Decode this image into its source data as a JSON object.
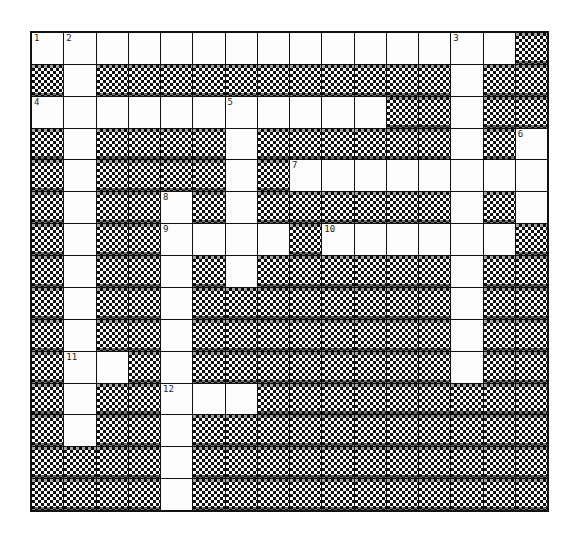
{
  "puzzle": {
    "rows": 15,
    "cols": 16,
    "colors": {
      "white": "#fdfdfd",
      "black": "#111111",
      "border": "#111111"
    },
    "grid": [
      "###############.",
      ".#...........#..",
      "###########..#..",
      ".#....#......#.#",
      ".#....#.########",
      ".#..#.#......#.#",
      ".#..####.######.",
      ".#..#.#......#..",
      ".#..#........#..",
      ".#..#........#..",
      ".##.#........#..",
      ".#..###.........",
      ".#..#...........",
      "....#...........",
      "....#..........."
    ],
    "numbers": [
      {
        "row": 0,
        "col": 0,
        "n": "1"
      },
      {
        "row": 0,
        "col": 1,
        "n": "2"
      },
      {
        "row": 0,
        "col": 13,
        "n": "3"
      },
      {
        "row": 2,
        "col": 0,
        "n": "4"
      },
      {
        "row": 2,
        "col": 6,
        "n": "5"
      },
      {
        "row": 3,
        "col": 15,
        "n": "6"
      },
      {
        "row": 4,
        "col": 8,
        "n": "7"
      },
      {
        "row": 5,
        "col": 4,
        "n": "8"
      },
      {
        "row": 6,
        "col": 4,
        "n": "9"
      },
      {
        "row": 6,
        "col": 9,
        "n": "10"
      },
      {
        "row": 10,
        "col": 1,
        "n": "11"
      },
      {
        "row": 11,
        "col": 4,
        "n": "12"
      }
    ]
  }
}
